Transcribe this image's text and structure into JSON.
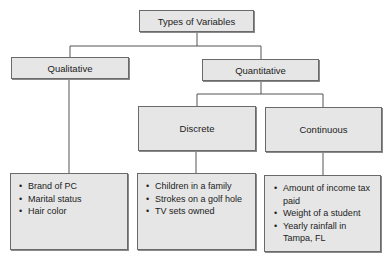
{
  "diagram": {
    "root": {
      "label": "Types of Variables"
    },
    "qualitative": {
      "label": "Qualitative",
      "examples": [
        "Brand of PC",
        "Marital status",
        "Hair color"
      ]
    },
    "quantitative": {
      "label": "Quantitative",
      "discrete": {
        "label": "Discrete",
        "examples": [
          "Children in a family",
          "Strokes on a golf hole",
          "TV sets owned"
        ]
      },
      "continuous": {
        "label": "Continuous",
        "examples": [
          "Amount of income tax paid",
          "Weight of a student",
          "Yearly rainfall in Tampa, FL"
        ]
      }
    },
    "colors": {
      "box_fill": "#e6e6e6",
      "box_border": "#6a6a6a",
      "line": "#555555"
    }
  }
}
